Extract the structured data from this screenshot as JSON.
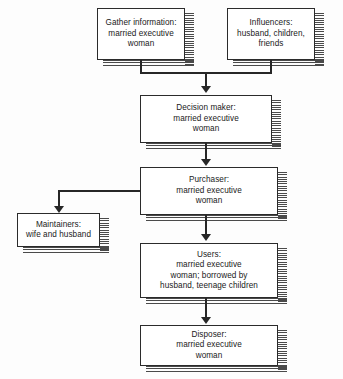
{
  "diagram": {
    "type": "flowchart",
    "nodes": [
      {
        "id": "gather",
        "name": "gather-information",
        "label": "Gather information:\nmarried executive\nwoman"
      },
      {
        "id": "influencers",
        "name": "influencers",
        "label": "Influencers:\nhusband, children,\nfriends"
      },
      {
        "id": "decision",
        "name": "decision-maker",
        "label": "Decision maker:\nmarried executive\nwoman"
      },
      {
        "id": "purchaser",
        "name": "purchaser",
        "label": "Purchaser:\nmarried executive\nwoman"
      },
      {
        "id": "maintainers",
        "name": "maintainers",
        "label": "Maintainers:\nwife and husband"
      },
      {
        "id": "users",
        "name": "users",
        "label": "Users:\nmarried executive\nwoman; borrowed by\nhusband, teenage children"
      },
      {
        "id": "disposer",
        "name": "disposer",
        "label": "Disposer:\nmarried executive\nwoman"
      }
    ],
    "edges": [
      {
        "from": "gather",
        "to": "decision"
      },
      {
        "from": "influencers",
        "to": "decision"
      },
      {
        "from": "decision",
        "to": "purchaser"
      },
      {
        "from": "purchaser",
        "to": "maintainers"
      },
      {
        "from": "purchaser",
        "to": "users"
      },
      {
        "from": "users",
        "to": "disposer"
      }
    ],
    "colors": {
      "background": "#fdfdfd",
      "box_fill": "#ffffff",
      "box_border": "#2b2b2b",
      "connector": "#272727",
      "shadow_hatch": "#4a4a4a",
      "text": "#1a1a1a"
    }
  }
}
